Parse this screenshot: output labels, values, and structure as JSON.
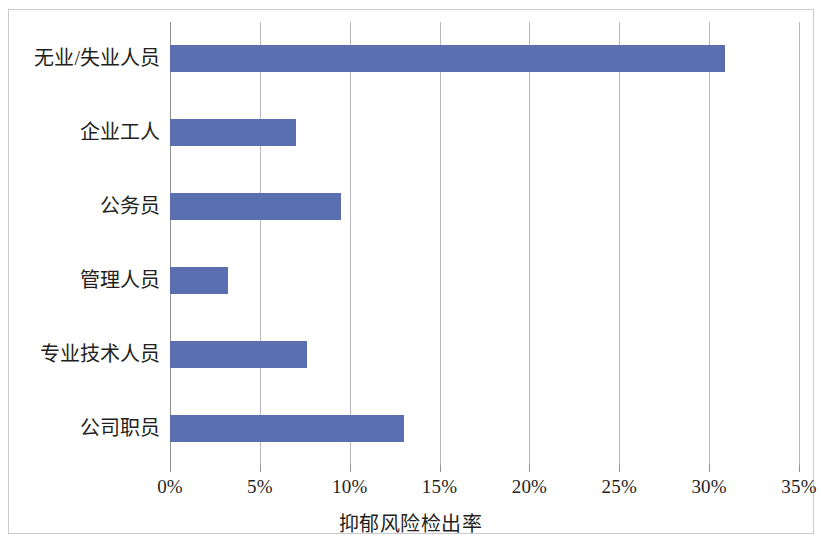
{
  "chart_data": {
    "type": "bar",
    "orientation": "horizontal",
    "title": "",
    "xlabel": "抑郁风险检出率",
    "ylabel": "",
    "categories": [
      "无业/失业人员",
      "企业工人",
      "公务员",
      "管理人员",
      "专业技术人员",
      "公司职员"
    ],
    "values": [
      30.9,
      7.0,
      9.5,
      3.2,
      7.6,
      13.0
    ],
    "value_unit": "%",
    "xlim": [
      0,
      35
    ],
    "xtick_values": [
      0,
      5,
      10,
      15,
      20,
      25,
      30,
      35
    ],
    "xtick_labels": [
      "0%",
      "5%",
      "10%",
      "15%",
      "20%",
      "25%",
      "30%",
      "35%"
    ],
    "grid": "vertical",
    "legend": "none",
    "bar_color": "#5b6fb0",
    "gridline_color": "#b9b9bf",
    "frame_color": "#c9c9cf",
    "text_color": "#231f20"
  }
}
